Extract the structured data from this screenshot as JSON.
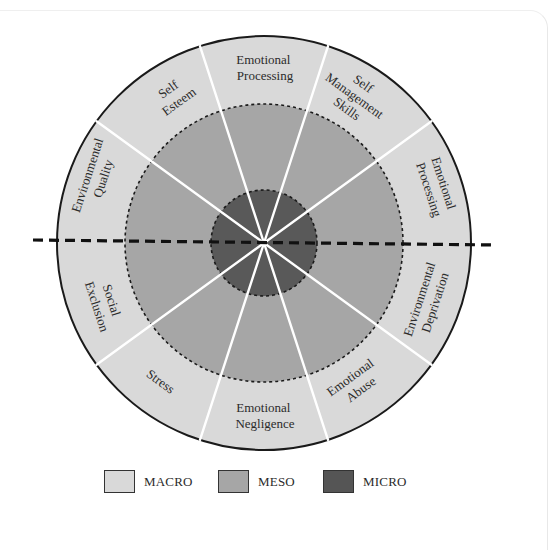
{
  "diagram": {
    "center": [
      264,
      243
    ],
    "radii": {
      "macro": 207,
      "meso": 139,
      "micro": 53
    },
    "colors": {
      "macro": "#d9d9d9",
      "meso": "#a6a6a6",
      "micro": "#595959",
      "outline": "#1a1a1a",
      "spoke": "#ffffff",
      "divider": "#111111"
    },
    "spoke_angles_deg": [
      36,
      72,
      108,
      144,
      216,
      252,
      288,
      324
    ],
    "sectors": [
      {
        "id": "top",
        "label_lines": [
          "Emotional",
          "Processing"
        ]
      },
      {
        "id": "upper-left",
        "label_lines": [
          "Self",
          "Esteem"
        ]
      },
      {
        "id": "upper-right",
        "label_lines": [
          "Self",
          "Management",
          "Skills"
        ]
      },
      {
        "id": "left-upper",
        "label_lines": [
          "Environmental",
          "Quality"
        ]
      },
      {
        "id": "right-upper",
        "label_lines": [
          "Emotional",
          "Processing"
        ]
      },
      {
        "id": "left-lower",
        "label_lines": [
          "Social",
          "Exclusion"
        ]
      },
      {
        "id": "right-lower",
        "label_lines": [
          "Environmental",
          "Deprivation"
        ]
      },
      {
        "id": "lower-left",
        "label_lines": [
          "Stress"
        ]
      },
      {
        "id": "lower-right",
        "label_lines": [
          "Emotional",
          "Abuse"
        ]
      },
      {
        "id": "bottom",
        "label_lines": [
          "Emotional",
          "Negligence"
        ]
      }
    ]
  },
  "legend": [
    {
      "label": "MACRO",
      "color": "#d9d9d9"
    },
    {
      "label": "MESO",
      "color": "#a6a6a6"
    },
    {
      "label": "MICRO",
      "color": "#555555"
    }
  ]
}
